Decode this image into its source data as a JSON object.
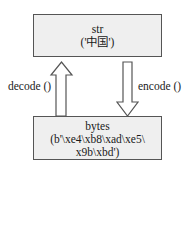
{
  "diagram": {
    "str_box": {
      "title": "str",
      "value": "('中国')"
    },
    "bytes_box": {
      "title": "bytes",
      "value_line1": "(b'\\xe4\\xb8\\xad\\xe5\\",
      "value_line2": "x9b\\xbd')"
    },
    "decode_label": "decode ()",
    "encode_label": "encode ()"
  }
}
